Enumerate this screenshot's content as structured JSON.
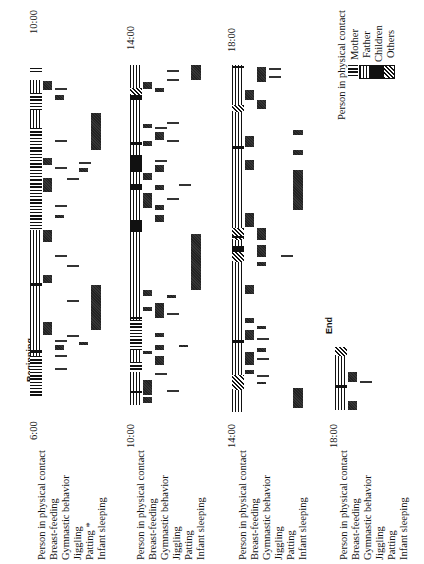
{
  "chart_data": {
    "type": "timeline",
    "orientation": "rotated 90deg counter-clockwise (time runs bottom to top)",
    "title": "",
    "row_labels": [
      "Person in physical contact",
      "Breast-feeding",
      "Gymnastic behavior",
      "Jiggling",
      "Patting",
      "Infant sleeping"
    ],
    "legend": {
      "title": "Person in physical contact",
      "entries": [
        {
          "label": "Mother",
          "pattern": "horizontal-lines"
        },
        {
          "label": "Father",
          "pattern": "vertical-lines"
        },
        {
          "label": "Children",
          "pattern": "solid-black"
        },
        {
          "label": "Others",
          "pattern": "diagonal-hatch"
        }
      ]
    },
    "annotations": [
      "Beginning",
      "End"
    ],
    "strips": [
      {
        "start": "6:00",
        "end": "10:00",
        "row_labels": [
          "Person in physical contact",
          "Breast-feeding",
          "Gymnastic behavior",
          "Jiggling",
          "Patting *",
          "Infant sleeping"
        ],
        "marker": "Beginning",
        "col_x": 30,
        "segments": [
          {
            "row": 0,
            "y0": 356,
            "y1": 398,
            "p": "mother"
          },
          {
            "row": 0,
            "y0": 345,
            "y1": 356,
            "p": "father"
          },
          {
            "row": 0,
            "y0": 350,
            "y1": 353,
            "p": "children"
          },
          {
            "row": 0,
            "y0": 230,
            "y1": 345,
            "p": "father"
          },
          {
            "row": 0,
            "y0": 283,
            "y1": 286,
            "p": "children"
          },
          {
            "row": 0,
            "y0": 150,
            "y1": 230,
            "p": "father"
          },
          {
            "row": 0,
            "y0": 148,
            "y1": 150,
            "p": "children"
          },
          {
            "row": 0,
            "y0": 230,
            "y1": 230,
            "p": "father"
          },
          {
            "row": 0,
            "y0": 180,
            "y1": 230,
            "p": "mother"
          },
          {
            "row": 0,
            "y0": 100,
            "y1": 150,
            "p": "father"
          },
          {
            "row": 0,
            "y0": 128,
            "y1": 180,
            "p": "mother"
          },
          {
            "row": 0,
            "y0": 80,
            "y1": 93,
            "p": "father"
          },
          {
            "row": 0,
            "y0": 93,
            "y1": 110,
            "p": "mother"
          },
          {
            "row": 0,
            "y0": 68,
            "y1": 72,
            "p": "mother"
          },
          {
            "row": 1,
            "y0": 322,
            "y1": 335,
            "p": "gray"
          },
          {
            "row": 1,
            "y0": 275,
            "y1": 283,
            "p": "gray"
          },
          {
            "row": 1,
            "y0": 230,
            "y1": 242,
            "p": "gray"
          },
          {
            "row": 1,
            "y0": 178,
            "y1": 192,
            "p": "gray"
          },
          {
            "row": 1,
            "y0": 158,
            "y1": 165,
            "p": "gray"
          },
          {
            "row": 1,
            "y0": 81,
            "y1": 90,
            "p": "gray"
          },
          {
            "row": 2,
            "y0": 355,
            "y1": 358,
            "p": "line"
          },
          {
            "row": 2,
            "y0": 345,
            "y1": 350,
            "p": "gray"
          },
          {
            "row": 2,
            "y0": 340,
            "y1": 342,
            "p": "line"
          },
          {
            "row": 2,
            "y0": 368,
            "y1": 370,
            "p": "line"
          },
          {
            "row": 2,
            "y0": 255,
            "y1": 258,
            "p": "line"
          },
          {
            "row": 2,
            "y0": 215,
            "y1": 218,
            "p": "gray"
          },
          {
            "row": 2,
            "y0": 205,
            "y1": 208,
            "p": "line"
          },
          {
            "row": 2,
            "y0": 167,
            "y1": 169,
            "p": "line"
          },
          {
            "row": 2,
            "y0": 140,
            "y1": 140,
            "p": "line"
          },
          {
            "row": 2,
            "y0": 95,
            "y1": 100,
            "p": "gray"
          },
          {
            "row": 2,
            "y0": 88,
            "y1": 90,
            "p": "line"
          },
          {
            "row": 3,
            "y0": 335,
            "y1": 337,
            "p": "line"
          },
          {
            "row": 3,
            "y0": 300,
            "y1": 302,
            "p": "line"
          },
          {
            "row": 3,
            "y0": 265,
            "y1": 267,
            "p": "line"
          },
          {
            "row": 3,
            "y0": 178,
            "y1": 180,
            "p": "line"
          },
          {
            "row": 4,
            "y0": 342,
            "y1": 345,
            "p": "gray"
          },
          {
            "row": 4,
            "y0": 168,
            "y1": 172,
            "p": "gray"
          },
          {
            "row": 4,
            "y0": 162,
            "y1": 164,
            "p": "line"
          },
          {
            "row": 5,
            "y0": 285,
            "y1": 330,
            "p": "gray"
          },
          {
            "row": 5,
            "y0": 113,
            "y1": 150,
            "p": "gray"
          }
        ]
      },
      {
        "start": "10:00",
        "end": "14:00",
        "row_labels": [
          "Person in physical contact",
          "Breast-feeding",
          "Gymnastic behavior",
          "Jiggling",
          "Patting",
          "Infant sleeping"
        ],
        "col_x": 130,
        "segments": [
          {
            "row": 0,
            "y0": 290,
            "y1": 405,
            "p": "father"
          },
          {
            "row": 0,
            "y0": 320,
            "y1": 350,
            "p": "mother"
          },
          {
            "row": 0,
            "y0": 362,
            "y1": 372,
            "p": "mother"
          },
          {
            "row": 0,
            "y0": 391,
            "y1": 393,
            "p": "children"
          },
          {
            "row": 0,
            "y0": 317,
            "y1": 319,
            "p": "children"
          },
          {
            "row": 0,
            "y0": 65,
            "y1": 290,
            "p": "father"
          },
          {
            "row": 0,
            "y0": 88,
            "y1": 95,
            "p": "others"
          },
          {
            "row": 0,
            "y0": 95,
            "y1": 100,
            "p": "children"
          },
          {
            "row": 0,
            "y0": 142,
            "y1": 145,
            "p": "children"
          },
          {
            "row": 0,
            "y0": 155,
            "y1": 157,
            "p": "children"
          },
          {
            "row": 0,
            "y0": 155,
            "y1": 172,
            "p": "children"
          },
          {
            "row": 0,
            "y0": 184,
            "y1": 190,
            "p": "children"
          },
          {
            "row": 0,
            "y0": 220,
            "y1": 232,
            "p": "children"
          },
          {
            "row": 1,
            "y0": 82,
            "y1": 89,
            "p": "gray"
          },
          {
            "row": 1,
            "y0": 124,
            "y1": 128,
            "p": "gray"
          },
          {
            "row": 1,
            "y0": 141,
            "y1": 146,
            "p": "gray"
          },
          {
            "row": 1,
            "y0": 173,
            "y1": 180,
            "p": "gray"
          },
          {
            "row": 1,
            "y0": 193,
            "y1": 208,
            "p": "gray"
          },
          {
            "row": 1,
            "y0": 290,
            "y1": 296,
            "p": "gray"
          },
          {
            "row": 1,
            "y0": 307,
            "y1": 311,
            "p": "gray"
          },
          {
            "row": 1,
            "y0": 351,
            "y1": 354,
            "p": "gray"
          },
          {
            "row": 1,
            "y0": 380,
            "y1": 395,
            "p": "gray"
          },
          {
            "row": 1,
            "y0": 397,
            "y1": 403,
            "p": "gray"
          },
          {
            "row": 2,
            "y0": 88,
            "y1": 92,
            "p": "gray"
          },
          {
            "row": 2,
            "y0": 127,
            "y1": 130,
            "p": "line"
          },
          {
            "row": 2,
            "y0": 132,
            "y1": 140,
            "p": "gray"
          },
          {
            "row": 2,
            "y0": 160,
            "y1": 162,
            "p": "line"
          },
          {
            "row": 2,
            "y0": 165,
            "y1": 172,
            "p": "gray"
          },
          {
            "row": 2,
            "y0": 185,
            "y1": 190,
            "p": "gray"
          },
          {
            "row": 2,
            "y0": 205,
            "y1": 210,
            "p": "gray"
          },
          {
            "row": 2,
            "y0": 215,
            "y1": 222,
            "p": "gray"
          },
          {
            "row": 2,
            "y0": 303,
            "y1": 318,
            "p": "gray"
          },
          {
            "row": 2,
            "y0": 333,
            "y1": 337,
            "p": "gray"
          },
          {
            "row": 2,
            "y0": 345,
            "y1": 350,
            "p": "gray"
          },
          {
            "row": 2,
            "y0": 356,
            "y1": 365,
            "p": "gray"
          },
          {
            "row": 2,
            "y0": 373,
            "y1": 376,
            "p": "line"
          },
          {
            "row": 3,
            "y0": 70,
            "y1": 72,
            "p": "line"
          },
          {
            "row": 3,
            "y0": 79,
            "y1": 81,
            "p": "line"
          },
          {
            "row": 3,
            "y0": 122,
            "y1": 124,
            "p": "line"
          },
          {
            "row": 3,
            "y0": 140,
            "y1": 141,
            "p": "line"
          },
          {
            "row": 3,
            "y0": 198,
            "y1": 200,
            "p": "line"
          },
          {
            "row": 3,
            "y0": 295,
            "y1": 298,
            "p": "gray"
          },
          {
            "row": 3,
            "y0": 313,
            "y1": 315,
            "p": "line"
          },
          {
            "row": 3,
            "y0": 390,
            "y1": 392,
            "p": "line"
          },
          {
            "row": 4,
            "y0": 184,
            "y1": 186,
            "p": "line"
          },
          {
            "row": 4,
            "y0": 345,
            "y1": 347,
            "p": "gray"
          },
          {
            "row": 5,
            "y0": 65,
            "y1": 80,
            "p": "gray"
          },
          {
            "row": 5,
            "y0": 234,
            "y1": 290,
            "p": "gray"
          }
        ]
      },
      {
        "start": "14:00",
        "end": "18:00",
        "row_labels": [
          "Person in physical contact",
          "Breast-feeding",
          "Gymnastic behavior",
          "Jiggling",
          "Patting",
          "Infant sleeping"
        ],
        "col_x": 232,
        "segments": [
          {
            "row": 0,
            "y0": 65,
            "y1": 412,
            "p": "father"
          },
          {
            "row": 0,
            "y0": 66,
            "y1": 68,
            "p": "children"
          },
          {
            "row": 0,
            "y0": 105,
            "y1": 112,
            "p": "others"
          },
          {
            "row": 0,
            "y0": 146,
            "y1": 149,
            "p": "children"
          },
          {
            "row": 0,
            "y0": 228,
            "y1": 240,
            "p": "others"
          },
          {
            "row": 0,
            "y0": 236,
            "y1": 238,
            "p": "children"
          },
          {
            "row": 0,
            "y0": 246,
            "y1": 252,
            "p": "children"
          },
          {
            "row": 0,
            "y0": 252,
            "y1": 262,
            "p": "others"
          },
          {
            "row": 0,
            "y0": 340,
            "y1": 343,
            "p": "children"
          },
          {
            "row": 0,
            "y0": 375,
            "y1": 390,
            "p": "others"
          },
          {
            "row": 1,
            "y0": 90,
            "y1": 100,
            "p": "gray"
          },
          {
            "row": 1,
            "y0": 136,
            "y1": 147,
            "p": "gray"
          },
          {
            "row": 1,
            "y0": 160,
            "y1": 170,
            "p": "gray"
          },
          {
            "row": 1,
            "y0": 213,
            "y1": 227,
            "p": "gray"
          },
          {
            "row": 1,
            "y0": 285,
            "y1": 294,
            "p": "gray"
          },
          {
            "row": 1,
            "y0": 318,
            "y1": 323,
            "p": "gray"
          },
          {
            "row": 1,
            "y0": 330,
            "y1": 340,
            "p": "gray"
          },
          {
            "row": 1,
            "y0": 352,
            "y1": 365,
            "p": "gray"
          },
          {
            "row": 1,
            "y0": 370,
            "y1": 374,
            "p": "gray"
          },
          {
            "row": 2,
            "y0": 67,
            "y1": 76,
            "p": "gray"
          },
          {
            "row": 2,
            "y0": 76,
            "y1": 82,
            "p": "gray"
          },
          {
            "row": 2,
            "y0": 100,
            "y1": 109,
            "p": "gray"
          },
          {
            "row": 2,
            "y0": 228,
            "y1": 240,
            "p": "gray"
          },
          {
            "row": 2,
            "y0": 245,
            "y1": 257,
            "p": "gray"
          },
          {
            "row": 2,
            "y0": 262,
            "y1": 266,
            "p": "gray"
          },
          {
            "row": 2,
            "y0": 326,
            "y1": 329,
            "p": "gray"
          },
          {
            "row": 2,
            "y0": 338,
            "y1": 341,
            "p": "line"
          },
          {
            "row": 2,
            "y0": 348,
            "y1": 352,
            "p": "gray"
          },
          {
            "row": 2,
            "y0": 358,
            "y1": 360,
            "p": "line"
          },
          {
            "row": 2,
            "y0": 375,
            "y1": 377,
            "p": "line"
          },
          {
            "row": 2,
            "y0": 382,
            "y1": 384,
            "p": "gray"
          },
          {
            "row": 3,
            "y0": 68,
            "y1": 70,
            "p": "line"
          },
          {
            "row": 3,
            "y0": 76,
            "y1": 78,
            "p": "line"
          },
          {
            "row": 4,
            "y0": 255,
            "y1": 256,
            "p": "line"
          },
          {
            "row": 5,
            "y0": 130,
            "y1": 135,
            "p": "gray"
          },
          {
            "row": 5,
            "y0": 150,
            "y1": 155,
            "p": "gray"
          },
          {
            "row": 5,
            "y0": 170,
            "y1": 210,
            "p": "gray"
          },
          {
            "row": 5,
            "y0": 388,
            "y1": 408,
            "p": "gray"
          }
        ]
      },
      {
        "start": "18:00",
        "end": "End",
        "row_labels": [
          "Person in physical contact",
          "Breast-feeding",
          "Gymnastic behavior",
          "Jiggling",
          "Patting",
          "Infant sleeping"
        ],
        "marker": "End",
        "col_x": 335,
        "segments": [
          {
            "row": 0,
            "y0": 352,
            "y1": 410,
            "p": "father"
          },
          {
            "row": 0,
            "y0": 347,
            "y1": 356,
            "p": "others"
          },
          {
            "row": 0,
            "y0": 385,
            "y1": 388,
            "p": "children"
          },
          {
            "row": 1,
            "y0": 372,
            "y1": 382,
            "p": "gray"
          },
          {
            "row": 1,
            "y0": 401,
            "y1": 410,
            "p": "gray"
          },
          {
            "row": 2,
            "y0": 381,
            "y1": 383,
            "p": "line"
          }
        ]
      }
    ]
  },
  "strips_meta": [
    {
      "time_label": "6:00",
      "end_time_label": "10:00"
    },
    {
      "time_label": "10:00",
      "end_time_label": "14:00"
    },
    {
      "time_label": "14:00",
      "end_time_label": "18:00"
    },
    {
      "time_label": "18:00"
    }
  ],
  "labels": {
    "strip1": [
      "Person in physical contact",
      "Breast-feeding",
      "Gymnastic behavior",
      "Jiggling",
      "Patting *",
      "Infant sleeping"
    ],
    "strip2": [
      "Person in physical contact",
      "Breast-feeding",
      "Gymnastic behavior",
      "Jiggling",
      "Patting",
      "Infant sleeping"
    ],
    "strip3": [
      "Person in physical contact",
      "Breast-feeding",
      "Gymnastic behavior",
      "Jiggling",
      "Patting",
      "Infant sleeping"
    ],
    "strip4": [
      "Person in physical contact",
      "Breast-feeding",
      "Gymnastic behavior",
      "Jiggling",
      "Patting",
      "Infant sleeping"
    ],
    "beginning": "Beginning",
    "end": "End"
  },
  "legend": {
    "title": "Person in physical contact",
    "mother": "Mother",
    "father": "Father",
    "children": "Children",
    "others": "Others"
  },
  "colors": {
    "ink": "#111111",
    "gray_fill": "#666666",
    "background": "#ffffff"
  }
}
